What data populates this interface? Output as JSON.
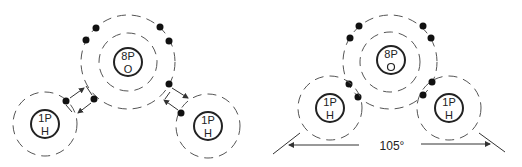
{
  "left_diagram": {
    "oxygen": {
      "protons": "8P",
      "symbol": "O"
    },
    "hydrogen_left": {
      "protons": "1P",
      "symbol": "H"
    },
    "hydrogen_right": {
      "protons": "1P",
      "symbol": "H"
    }
  },
  "right_diagram": {
    "oxygen": {
      "protons": "8P",
      "symbol": "O"
    },
    "hydrogen_left": {
      "protons": "1P",
      "symbol": "H"
    },
    "hydrogen_right": {
      "protons": "1P",
      "symbol": "H"
    },
    "bond_angle": "105°"
  }
}
